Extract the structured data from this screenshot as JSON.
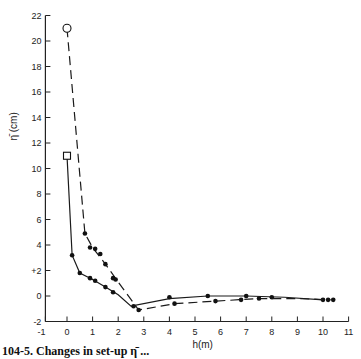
{
  "chart_data": {
    "type": "line",
    "title": "",
    "xlabel": "h(m)",
    "ylabel": "η̄ (cm)",
    "xlim": [
      -1,
      11
    ],
    "ylim": [
      -2,
      22
    ],
    "x_ticks": [
      -1,
      0,
      1,
      2,
      3,
      4,
      5,
      6,
      7,
      8,
      9,
      10,
      11
    ],
    "x_tick_labels": [
      "-1",
      "0",
      "1",
      "2",
      "3",
      "4",
      "5",
      "6",
      "7",
      "8",
      "9",
      "10",
      "11"
    ],
    "y_ticks": [
      -2,
      0,
      2,
      4,
      6,
      8,
      10,
      12,
      14,
      16,
      18,
      20,
      22
    ],
    "y_tick_labels": [
      "-2",
      "0",
      "+2",
      "4",
      "6",
      "8",
      "10",
      "12",
      "14",
      "16",
      "18",
      "20",
      "22"
    ],
    "grid": false,
    "legend": "none",
    "series": [
      {
        "name": "solid-curve",
        "style": "solid",
        "start_marker": "open-square",
        "start_point": [
          0,
          11
        ],
        "x": [
          0.2,
          0.5,
          0.9,
          1.1,
          1.5,
          1.8,
          2.6,
          4.0,
          5.5,
          7.0,
          8.0,
          10.0
        ],
        "y": [
          3.2,
          1.8,
          1.4,
          1.2,
          0.7,
          0.3,
          -0.8,
          -0.1,
          0.0,
          0.0,
          -0.1,
          -0.3
        ],
        "line_x": [
          0,
          0.2,
          0.5,
          1.0,
          1.5,
          2.0,
          2.5,
          4.0,
          5.5,
          7.0,
          8.5,
          10.0
        ],
        "line_y": [
          11,
          3.2,
          1.8,
          1.3,
          0.7,
          0.1,
          -0.8,
          -0.2,
          0.0,
          0.0,
          -0.1,
          -0.3
        ]
      },
      {
        "name": "dashed-curve",
        "style": "dashed",
        "start_marker": "open-circle",
        "start_point": [
          0,
          21
        ],
        "x": [
          0.7,
          0.9,
          1.1,
          1.3,
          1.5,
          1.8,
          1.9,
          2.8,
          4.2,
          5.8,
          6.8,
          7.5,
          10.2,
          10.4
        ],
        "y": [
          4.9,
          3.8,
          3.7,
          3.3,
          2.5,
          1.4,
          1.3,
          -1.1,
          -0.6,
          -0.4,
          -0.3,
          -0.2,
          -0.3,
          -0.3
        ],
        "line_x": [
          0,
          0.7,
          1.0,
          1.5,
          2.0,
          2.8,
          4.2,
          5.8,
          7.5,
          9.0,
          10.3
        ],
        "line_y": [
          21,
          4.9,
          3.8,
          2.5,
          1.1,
          -1.1,
          -0.6,
          -0.4,
          -0.2,
          -0.2,
          -0.3
        ]
      }
    ]
  },
  "caption": {
    "text": "104-5.  Changes in set-up η̄ ..."
  }
}
